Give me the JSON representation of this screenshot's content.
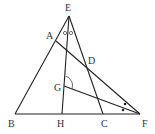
{
  "diagram": {
    "type": "geometry",
    "points": [
      {
        "name": "E",
        "x": 69,
        "y": 16,
        "label_x": 65,
        "label_y": 11
      },
      {
        "name": "A",
        "x": 56,
        "y": 41,
        "label_x": 46,
        "label_y": 39
      },
      {
        "name": "D",
        "x": 87,
        "y": 66,
        "label_x": 88,
        "label_y": 64
      },
      {
        "name": "G",
        "x": 64,
        "y": 86,
        "label_x": 54,
        "label_y": 91
      },
      {
        "name": "B",
        "x": 15,
        "y": 114,
        "label_x": 8,
        "label_y": 127
      },
      {
        "name": "H",
        "x": 62,
        "y": 114,
        "label_x": 57,
        "label_y": 127
      },
      {
        "name": "C",
        "x": 103,
        "y": 114,
        "label_x": 101,
        "label_y": 127
      },
      {
        "name": "F",
        "x": 140,
        "y": 114,
        "label_x": 142,
        "label_y": 127
      }
    ],
    "labels": {
      "E": "E",
      "A": "A",
      "D": "D",
      "G": "G",
      "B": "B",
      "H": "H",
      "C": "C",
      "F": "F"
    },
    "segments": [
      "EB",
      "EC",
      "EH",
      "BF",
      "AF",
      "GF"
    ],
    "angle_marks": [
      {
        "at": "E",
        "style": "circle",
        "count": 2,
        "note": "equal angles AEH and HEC"
      },
      {
        "at": "G",
        "style": "arc",
        "between": "GE and GF"
      },
      {
        "at": "F",
        "style": "dot",
        "count": 2,
        "note": "equal angles AFG and GFB"
      }
    ],
    "colors": {
      "line": "#222222",
      "label": "#333333",
      "background": "#ffffff"
    }
  }
}
